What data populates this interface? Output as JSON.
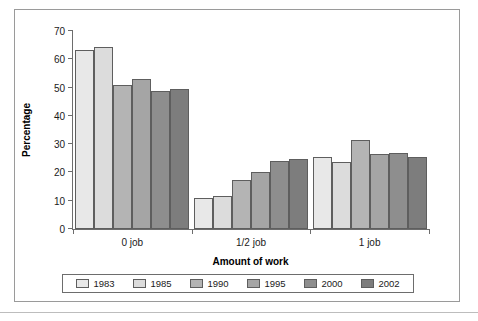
{
  "chart_data": {
    "type": "bar",
    "title": "",
    "xlabel": "Amount of work",
    "ylabel": "Percentage",
    "categories": [
      "0 job",
      "1/2 job",
      "1 job"
    ],
    "ylim": [
      0,
      70
    ],
    "yticks": [
      0,
      10,
      20,
      30,
      40,
      50,
      60,
      70
    ],
    "grid": false,
    "legend_position": "bottom",
    "series": [
      {
        "name": "1983",
        "color": "#e8e8e8",
        "values": [
          63.3,
          11.0,
          25.5
        ]
      },
      {
        "name": "1985",
        "color": "#dcdcdc",
        "values": [
          64.2,
          11.7,
          23.6
        ]
      },
      {
        "name": "1990",
        "color": "#b4b4b4",
        "values": [
          51.0,
          17.3,
          31.5
        ]
      },
      {
        "name": "1995",
        "color": "#a5a5a5",
        "values": [
          53.0,
          20.0,
          26.6
        ]
      },
      {
        "name": "2000",
        "color": "#8e8e8e",
        "values": [
          48.8,
          23.9,
          27.0
        ]
      },
      {
        "name": "2002",
        "color": "#7d7d7d",
        "values": [
          49.4,
          24.8,
          25.4
        ]
      }
    ]
  },
  "colors": {
    "frame": "#9a9a9a",
    "axis": "#6d6d6d",
    "bar_outline": "#5e5e5e",
    "text": "#1a1a1a",
    "background": "#ffffff"
  }
}
